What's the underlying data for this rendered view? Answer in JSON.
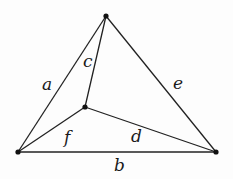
{
  "diagram": {
    "type": "graph",
    "vertices": [
      {
        "id": "top",
        "x": 106,
        "y": 16
      },
      {
        "id": "bottom-left",
        "x": 18,
        "y": 152
      },
      {
        "id": "bottom-right",
        "x": 216,
        "y": 152
      },
      {
        "id": "inner",
        "x": 85,
        "y": 107
      }
    ],
    "edges": [
      {
        "label": "a",
        "from": "bottom-left",
        "to": "top",
        "label_x": 42,
        "label_y": 90
      },
      {
        "label": "b",
        "from": "bottom-left",
        "to": "bottom-right",
        "label_x": 114,
        "label_y": 171
      },
      {
        "label": "c",
        "from": "inner",
        "to": "top",
        "label_x": 83,
        "label_y": 67
      },
      {
        "label": "d",
        "from": "inner",
        "to": "bottom-right",
        "label_x": 131,
        "label_y": 142
      },
      {
        "label": "e",
        "from": "top",
        "to": "bottom-right",
        "label_x": 173,
        "label_y": 89
      },
      {
        "label": "f",
        "from": "bottom-left",
        "to": "inner",
        "label_x": 64,
        "label_y": 143
      }
    ]
  }
}
